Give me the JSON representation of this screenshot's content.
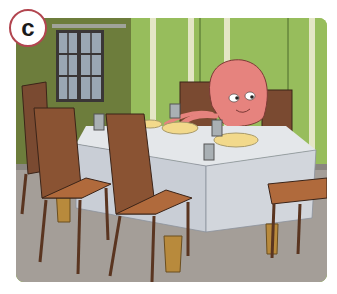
{
  "badge": {
    "label": "c",
    "border_color": "#b2454f"
  },
  "illustration": {
    "subject": "octopus sitting at a dining table",
    "description": "Cartoon of a pink octopus seated at a dining table with a white tablecloth, plates, glasses and cutlery, surrounded by brown wooden chairs, in a room with green striped walls and a window",
    "colors": {
      "left_wall": "#6d7d3c",
      "right_wall": "#97bd5c",
      "stripe": "#e4e6c6",
      "floor": "#a49e98",
      "tablecloth": "#d2d6dc",
      "chair": "#8a5333",
      "octopus": "#e6837e",
      "plate": "#f2d98b"
    }
  }
}
